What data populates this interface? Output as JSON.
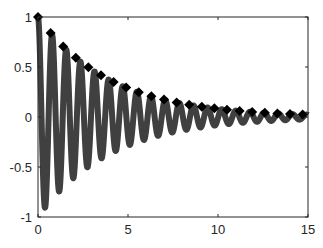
{
  "chart_data": {
    "type": "line",
    "title": "",
    "xlabel": "",
    "ylabel": "",
    "xlim": [
      0,
      15
    ],
    "ylim": [
      -1,
      1
    ],
    "grid": false,
    "legend": null,
    "x_ticks": [
      0,
      5,
      10,
      15
    ],
    "x_tick_labels": [
      "0",
      "5",
      "10",
      "15"
    ],
    "y_ticks": [
      -1,
      -0.5,
      0,
      0.5,
      1
    ],
    "y_tick_labels": [
      "-1",
      "-0.5",
      "0",
      "0.5",
      "1"
    ],
    "series": [
      {
        "name": "damped oscillation",
        "style": "solid thick line",
        "color": "#404040",
        "formula": "y = exp(-0.25 t) * cos(8 t)",
        "x_range": [
          0,
          15
        ],
        "key_points": [
          {
            "x": 0,
            "y": 1.0
          },
          {
            "x": 0.39,
            "y": -0.91
          },
          {
            "x": 0.79,
            "y": 0.82
          },
          {
            "x": 1.18,
            "y": -0.75
          },
          {
            "x": 1.57,
            "y": 0.68
          },
          {
            "x": 5.0,
            "y": 0.19
          },
          {
            "x": 10.0,
            "y": -0.01
          },
          {
            "x": 15.0,
            "y": 0.02
          }
        ]
      },
      {
        "name": "envelope",
        "style": "diamond markers",
        "color": "#000000",
        "formula": "y = exp(-0.25 t)",
        "marker_spacing": 0.7,
        "key_points": [
          {
            "x": 0,
            "y": 1.0
          },
          {
            "x": 5,
            "y": 0.29
          },
          {
            "x": 10,
            "y": 0.08
          },
          {
            "x": 15,
            "y": 0.02
          }
        ]
      }
    ]
  }
}
